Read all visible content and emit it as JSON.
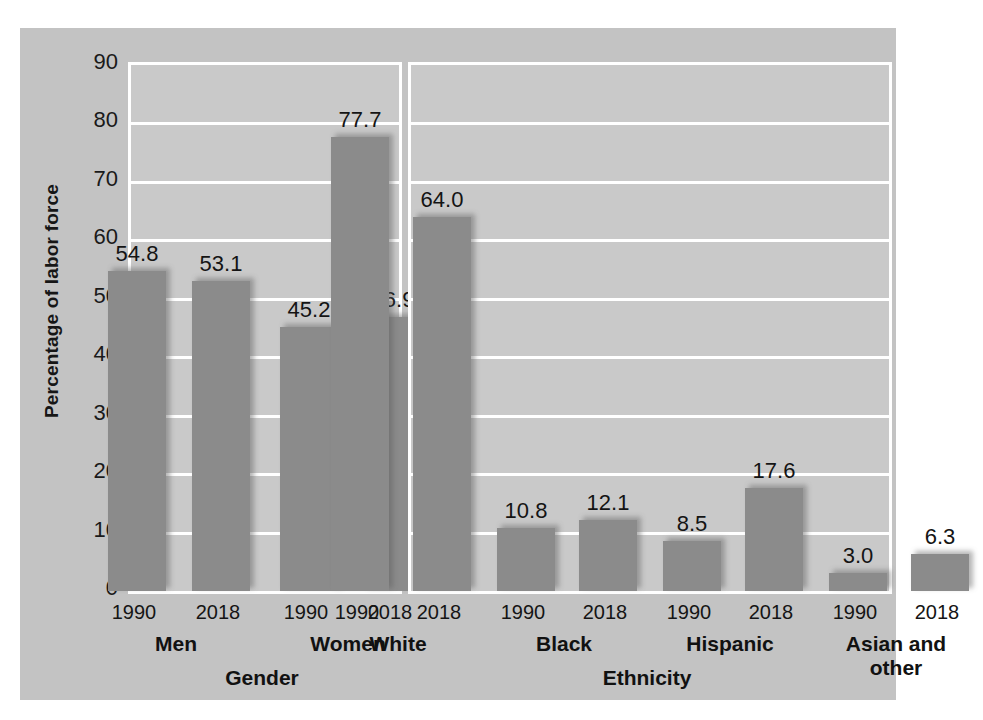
{
  "chart_data": {
    "type": "bar",
    "title": "",
    "xlabel": "",
    "ylabel": "Percentage of labor force",
    "ylim": [
      0,
      90
    ],
    "ytick_step": 10,
    "yticks": [
      "90",
      "80",
      "70",
      "60",
      "50",
      "40",
      "30",
      "20",
      "10",
      "0"
    ],
    "grid": true,
    "legend": "none",
    "series_label_style": "value labels above bars",
    "panels": [
      {
        "axis_title": "Gender",
        "groups": [
          {
            "label": "Men",
            "label_lines": [
              "Men"
            ],
            "bars": [
              {
                "x": "1990",
                "value": 54.8,
                "label": "54.8"
              },
              {
                "x": "2018",
                "value": 53.1,
                "label": "53.1"
              }
            ]
          },
          {
            "label": "Women",
            "label_lines": [
              "Women"
            ],
            "bars": [
              {
                "x": "1990",
                "value": 45.2,
                "label": "45.2"
              },
              {
                "x": "2018",
                "value": 46.9,
                "label": "46.9"
              }
            ]
          }
        ]
      },
      {
        "axis_title": "Ethnicity",
        "groups": [
          {
            "label": "White",
            "label_lines": [
              "White"
            ],
            "bars": [
              {
                "x": "1990",
                "value": 77.7,
                "label": "77.7"
              },
              {
                "x": "2018",
                "value": 64.0,
                "label": "64.0"
              }
            ]
          },
          {
            "label": "Black",
            "label_lines": [
              "Black"
            ],
            "bars": [
              {
                "x": "1990",
                "value": 10.8,
                "label": "10.8"
              },
              {
                "x": "2018",
                "value": 12.1,
                "label": "12.1"
              }
            ]
          },
          {
            "label": "Hispanic",
            "label_lines": [
              "Hispanic"
            ],
            "bars": [
              {
                "x": "1990",
                "value": 8.5,
                "label": "8.5"
              },
              {
                "x": "2018",
                "value": 17.6,
                "label": "17.6"
              }
            ]
          },
          {
            "label": "Asian and other",
            "label_lines": [
              "Asian and",
              "other"
            ],
            "bars": [
              {
                "x": "1990",
                "value": 3.0,
                "label": "3.0"
              },
              {
                "x": "2018",
                "value": 6.3,
                "label": "6.3"
              }
            ]
          }
        ]
      }
    ],
    "colors": {
      "bar": "#8b8b8b",
      "plot_background": "#c9c9c9",
      "figure_background": "#c3c3c3",
      "gridline": "#ffffff",
      "text": "#141414"
    }
  }
}
